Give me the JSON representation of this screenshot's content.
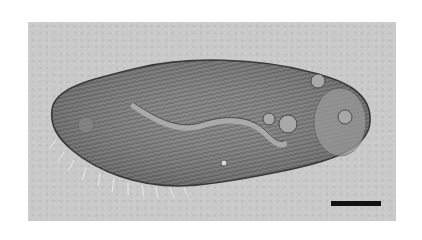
{
  "figure": {
    "imaging": "DIC light micrograph",
    "background_color": "#c9c9c9",
    "cell_color": "#7a7a7a",
    "scale_bar": {
      "color": "#111111",
      "label": ""
    }
  }
}
